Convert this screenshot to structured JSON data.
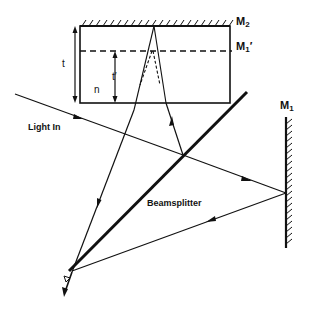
{
  "diagram": {
    "labels": {
      "mirror2": "M",
      "mirror2_sub": "2",
      "mirror1_image": "M",
      "mirror1_image_sub": "1",
      "mirror1_image_prime": "′",
      "mirror1": "M",
      "mirror1_sub": "1",
      "light_in": "Light In",
      "beamsplitter": "Beamsplitter",
      "thickness": "t",
      "apparent_thickness": "t′",
      "refractive_index": "n"
    },
    "colors": {
      "line": "#111111",
      "background": "#ffffff"
    }
  }
}
